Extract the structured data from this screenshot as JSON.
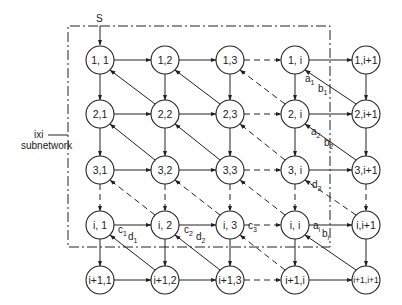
{
  "diagram": {
    "source_label": "S",
    "subnetwork_label_line1": "ixi",
    "subnetwork_label_line2": "subnetwork",
    "colors": {
      "line": "#222222",
      "background": "#ffffff"
    },
    "nodes": [
      {
        "id": "n11",
        "label": "1, 1",
        "cx": 100,
        "cy": 60
      },
      {
        "id": "n12",
        "label": "1,2",
        "cx": 165,
        "cy": 60
      },
      {
        "id": "n13",
        "label": "1,3",
        "cx": 230,
        "cy": 60
      },
      {
        "id": "n1i",
        "label": "1, i",
        "cx": 295,
        "cy": 60
      },
      {
        "id": "n1i1",
        "label": "1,i+1",
        "cx": 366,
        "cy": 60
      },
      {
        "id": "n21",
        "label": "2,1",
        "cx": 100,
        "cy": 114
      },
      {
        "id": "n22",
        "label": "2,2",
        "cx": 165,
        "cy": 114
      },
      {
        "id": "n23",
        "label": "2,3",
        "cx": 230,
        "cy": 114
      },
      {
        "id": "n2i",
        "label": "2, i",
        "cx": 295,
        "cy": 114
      },
      {
        "id": "n2i1",
        "label": "2,i+1",
        "cx": 366,
        "cy": 114
      },
      {
        "id": "n31",
        "label": "3,1",
        "cx": 100,
        "cy": 170
      },
      {
        "id": "n32",
        "label": "3,2",
        "cx": 165,
        "cy": 170
      },
      {
        "id": "n33",
        "label": "3,3",
        "cx": 230,
        "cy": 170
      },
      {
        "id": "n3i",
        "label": "3, i",
        "cx": 295,
        "cy": 170
      },
      {
        "id": "n3i1",
        "label": "3,i+1",
        "cx": 366,
        "cy": 170
      },
      {
        "id": "ni1",
        "label": "i, 1",
        "cx": 100,
        "cy": 225
      },
      {
        "id": "ni2",
        "label": "i, 2",
        "cx": 165,
        "cy": 225
      },
      {
        "id": "ni3",
        "label": "i, 3",
        "cx": 230,
        "cy": 225
      },
      {
        "id": "nii",
        "label": "i, i",
        "cx": 295,
        "cy": 225
      },
      {
        "id": "nii1",
        "label": "i,i+1",
        "cx": 366,
        "cy": 225
      },
      {
        "id": "ni11",
        "label": "i+1,1",
        "cx": 100,
        "cy": 280
      },
      {
        "id": "ni12",
        "label": "i+1,2",
        "cx": 165,
        "cy": 280
      },
      {
        "id": "ni13",
        "label": "i+1,3",
        "cx": 230,
        "cy": 280
      },
      {
        "id": "ni1i",
        "label": "i+1,i",
        "cx": 295,
        "cy": 280
      },
      {
        "id": "ni1i1",
        "label": "i+1,i+1",
        "cx": 366,
        "cy": 280
      }
    ],
    "edge_labels": [
      {
        "text": "a",
        "sub": "1",
        "x": 305,
        "y": 82
      },
      {
        "text": "b",
        "sub": "1",
        "x": 318,
        "y": 92
      },
      {
        "text": "a",
        "sub": "2",
        "x": 311,
        "y": 135
      },
      {
        "text": "b",
        "sub": "2",
        "x": 324,
        "y": 146
      },
      {
        "text": "d",
        "sub": "3",
        "x": 312,
        "y": 188
      },
      {
        "text": "a",
        "sub": "i",
        "x": 313,
        "y": 229
      },
      {
        "text": "b",
        "sub": "i",
        "x": 322,
        "y": 237
      },
      {
        "text": "c",
        "sub": "1",
        "x": 118,
        "y": 233
      },
      {
        "text": "d",
        "sub": "1",
        "x": 128,
        "y": 240
      },
      {
        "text": "c",
        "sub": "2",
        "x": 184,
        "y": 233
      },
      {
        "text": "d",
        "sub": "2",
        "x": 196,
        "y": 240
      },
      {
        "text": "c",
        "sub": "3",
        "x": 248,
        "y": 229
      }
    ]
  }
}
